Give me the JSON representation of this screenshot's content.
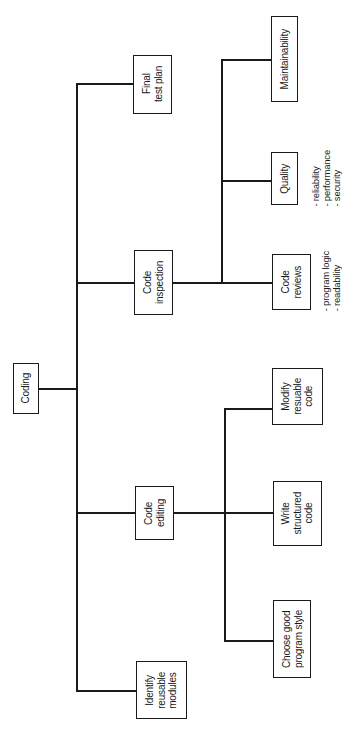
{
  "diagram": {
    "type": "hierarchy-tree",
    "orientation": "rotated-90-ccw",
    "root": {
      "label": "Coding",
      "children": [
        {
          "label": "Identify\nreusable\nmodules"
        },
        {
          "label": "Code\nediting",
          "children": [
            {
              "label": "Choose good\nprogram style"
            },
            {
              "label": "Write\nstructured\ncode"
            },
            {
              "label": "Modify\nresuable\ncode"
            }
          ]
        },
        {
          "label": "Code\ninspection",
          "children": [
            {
              "label": "Code\nreviews",
              "notes": "- program logic\n- readability"
            },
            {
              "label": "Quality",
              "notes": "- reliability\n- performance\n- security"
            },
            {
              "label": "Maintainability"
            }
          ]
        },
        {
          "label": "Final\ntest plan"
        }
      ]
    }
  },
  "nodes": {
    "coding": "Coding",
    "identify_reusable_modules": "Identify\nreusable\nmodules",
    "code_editing": "Code\nediting",
    "choose_good_program_style": "Choose good\nprogram style",
    "write_structured_code": "Write\nstructured\ncode",
    "modify_reusable_code": "Modify\nresuable\ncode",
    "code_inspection": "Code\ninspection",
    "code_reviews": "Code\nreviews",
    "quality": "Quality",
    "maintainability": "Maintainability",
    "final_test_plan": "Final\ntest plan"
  },
  "notes": {
    "code_reviews": "- program logic\n- readability",
    "quality": "- reliability\n- performance\n- security"
  },
  "colors": {
    "line": "#1a1a1a",
    "background": "#ffffff"
  }
}
